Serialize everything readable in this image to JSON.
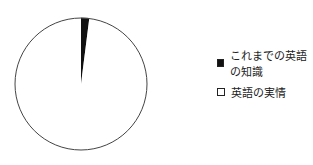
{
  "chart_data": {
    "type": "pie",
    "title": "",
    "categories": [
      "これまでの英語の知識",
      "英語の実情"
    ],
    "values": [
      2,
      98
    ],
    "colors": [
      "#111111",
      "#ffffff"
    ],
    "start_angle": "12 o'clock, clockwise",
    "legend_position": "right"
  },
  "legend": {
    "items": [
      {
        "label": "これまでの英語の知識",
        "color": "#111111"
      },
      {
        "label": "英語の実情",
        "color": "#ffffff"
      }
    ]
  }
}
